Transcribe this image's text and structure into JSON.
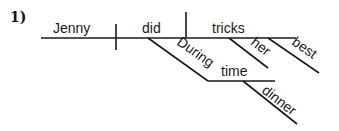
{
  "problem_number": "1)",
  "diagram": {
    "type": "sentence-diagram",
    "subject": "Jenny",
    "verb": "did",
    "direct_object": "tricks",
    "modifiers": {
      "preposition": "During",
      "prep_object": "time",
      "prep_object_modifier": "dinner",
      "object_modifier_1": "her",
      "object_modifier_2": "best"
    }
  }
}
